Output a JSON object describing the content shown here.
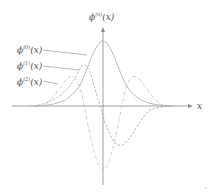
{
  "diagram": {
    "y_axis_label": {
      "base": "ϕ",
      "sup": "(n)",
      "arg": "(x)"
    },
    "x_axis_label": "x",
    "curve_labels": [
      {
        "base": "ϕ",
        "sup": "(0)",
        "arg": "(x)",
        "style": "solid"
      },
      {
        "base": "ϕ",
        "sup": "(1)",
        "arg": "(x)",
        "style": "dashed"
      },
      {
        "base": "ϕ",
        "sup": "(2)",
        "arg": "(x)",
        "style": "dash-dot"
      }
    ],
    "colors": {
      "axis": "#888888",
      "curve": "#aaaaaa",
      "text": "#555555"
    }
  }
}
